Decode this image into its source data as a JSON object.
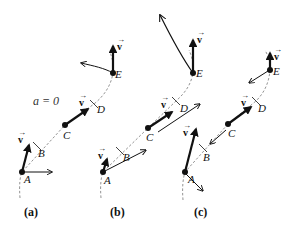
{
  "figure": {
    "panels": [
      {
        "caption": "(a)",
        "annotation": "a = 0",
        "points": [
          {
            "label": "A",
            "x": 22,
            "y": 172
          },
          {
            "label": "B",
            "x": 37,
            "y": 146
          },
          {
            "label": "C",
            "x": 65,
            "y": 125
          },
          {
            "label": "D",
            "x": 94,
            "y": 104
          },
          {
            "label": "E",
            "x": 113,
            "y": 73
          }
        ],
        "velocity_label": "v"
      },
      {
        "caption": "(b)",
        "points": [
          {
            "label": "A",
            "x": 103,
            "y": 172
          },
          {
            "label": "B",
            "x": 120,
            "y": 151
          },
          {
            "label": "C",
            "x": 148,
            "y": 128
          },
          {
            "label": "D",
            "x": 176,
            "y": 101
          },
          {
            "label": "E",
            "x": 193,
            "y": 73
          }
        ],
        "velocity_label": "v"
      },
      {
        "caption": "(c)",
        "points": [
          {
            "label": "A",
            "x": 185,
            "y": 172
          },
          {
            "label": "B",
            "x": 203,
            "y": 148
          },
          {
            "label": "C",
            "x": 228,
            "y": 124
          },
          {
            "label": "D",
            "x": 256,
            "y": 101
          },
          {
            "label": "E",
            "x": 270,
            "y": 70
          }
        ],
        "velocity_label": "v"
      }
    ]
  },
  "labels": {
    "v": "v",
    "vec": "→",
    "A": "A",
    "B": "B",
    "C": "C",
    "D": "D",
    "E": "E",
    "cap_a": "(a)",
    "cap_b": "(b)",
    "cap_c": "(c)",
    "a_zero": "a = 0"
  },
  "colors": {
    "ink": "#111111",
    "path": "#666666",
    "background": "#ffffff"
  }
}
